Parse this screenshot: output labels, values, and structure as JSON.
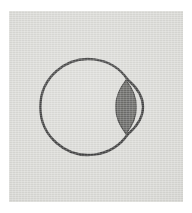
{
  "figure": {
    "caption": "",
    "kind": "line-drawing",
    "medium": "scanned grayscale plate"
  },
  "plate": {
    "background_color": "#d9d9d5",
    "page_color": "#ffffff",
    "margin_px": 9
  },
  "ink": {
    "outline_color": "#2b2b2b",
    "lens_fill_color": "#555552",
    "lens_edge_color": "#2f2f2d",
    "outline_width_px": 2.4
  },
  "parts": [
    {
      "id": "globe",
      "label": "eyeball globe",
      "shape": "circle",
      "center_x": 84,
      "center_y": 96,
      "radius": 48,
      "stroke": "#2b2b2b",
      "fill": "none"
    },
    {
      "id": "lens",
      "label": "lens",
      "shape": "lentil",
      "center_x": 117,
      "center_y": 96,
      "half_width": 10,
      "half_height": 27,
      "fill": "#555552"
    },
    {
      "id": "cornea",
      "label": "cornea arc",
      "shape": "arc",
      "top_x": 119,
      "top_y": 69,
      "bottom_x": 119,
      "bottom_y": 123,
      "bulge_x": 134,
      "stroke": "#2b2b2b",
      "fill": "none"
    }
  ]
}
